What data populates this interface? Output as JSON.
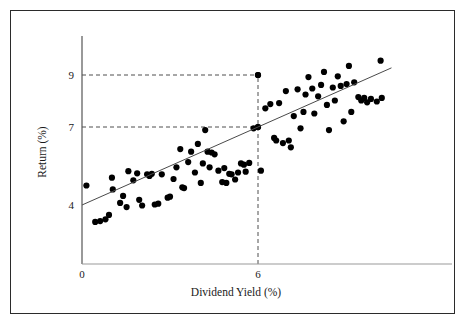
{
  "figure": {
    "border_color": "#2b2b2b",
    "background": "#ffffff"
  },
  "chart_data": {
    "type": "scatter",
    "title": "",
    "subtitle": "",
    "xlabel": "Dividend Yield (%)",
    "ylabel": "Return (%)",
    "xlim": [
      -0.2,
      11.0
    ],
    "ylim": [
      2.6,
      10.6
    ],
    "xticks": [
      "0",
      "6"
    ],
    "xtick_values": [
      0,
      6
    ],
    "yticks": [
      "4",
      "7",
      "9"
    ],
    "ytick_values": [
      4,
      7,
      9
    ],
    "grid": false,
    "legend": null,
    "marker_color": "#000000",
    "marker_size": 3.1,
    "fit_line": {
      "label": "regression-line",
      "color": "#4a4a4a",
      "width": 1.0,
      "intercept": 4.0,
      "slope": 0.5,
      "x_start": 0.0,
      "x_end": 10.55
    },
    "reference_lines": [
      {
        "name": "ref-horizontal-9",
        "orientation": "horizontal",
        "value": 9,
        "x_from": 0,
        "x_to": 6,
        "style": "dashed"
      },
      {
        "name": "ref-horizontal-7",
        "orientation": "horizontal",
        "value": 7,
        "x_from": 0,
        "x_to": 6,
        "style": "dashed"
      },
      {
        "name": "ref-vertical-6",
        "orientation": "vertical",
        "value": 6,
        "y_from": 2.6,
        "y_to": 9,
        "style": "dashed"
      }
    ],
    "highlight_points": [
      {
        "x": 6,
        "y": 9,
        "name": "point-at-6-9"
      },
      {
        "x": 6,
        "y": 7,
        "name": "point-at-6-7"
      }
    ],
    "points": [
      [
        0.15,
        4.75
      ],
      [
        0.45,
        3.35
      ],
      [
        0.62,
        3.38
      ],
      [
        0.8,
        3.45
      ],
      [
        0.92,
        3.62
      ],
      [
        1.02,
        5.05
      ],
      [
        1.05,
        4.6
      ],
      [
        1.3,
        4.08
      ],
      [
        1.4,
        4.35
      ],
      [
        1.52,
        3.92
      ],
      [
        1.58,
        5.3
      ],
      [
        1.75,
        4.95
      ],
      [
        1.88,
        5.22
      ],
      [
        1.95,
        4.2
      ],
      [
        2.05,
        3.98
      ],
      [
        2.22,
        5.18
      ],
      [
        2.3,
        5.12
      ],
      [
        2.38,
        5.2
      ],
      [
        2.48,
        4.02
      ],
      [
        2.6,
        4.05
      ],
      [
        2.72,
        5.18
      ],
      [
        2.92,
        4.28
      ],
      [
        3.0,
        4.32
      ],
      [
        3.12,
        5.0
      ],
      [
        3.22,
        5.45
      ],
      [
        3.35,
        6.15
      ],
      [
        3.42,
        4.68
      ],
      [
        3.48,
        4.65
      ],
      [
        3.62,
        5.65
      ],
      [
        3.72,
        6.05
      ],
      [
        3.85,
        5.25
      ],
      [
        3.95,
        6.35
      ],
      [
        4.05,
        4.85
      ],
      [
        4.12,
        5.6
      ],
      [
        4.2,
        6.88
      ],
      [
        4.28,
        6.05
      ],
      [
        4.35,
        5.45
      ],
      [
        4.42,
        6.02
      ],
      [
        4.52,
        5.95
      ],
      [
        4.65,
        5.32
      ],
      [
        4.78,
        4.88
      ],
      [
        4.85,
        5.42
      ],
      [
        4.92,
        4.85
      ],
      [
        5.02,
        5.2
      ],
      [
        5.1,
        5.18
      ],
      [
        5.22,
        4.98
      ],
      [
        5.32,
        5.25
      ],
      [
        5.42,
        5.6
      ],
      [
        5.52,
        5.55
      ],
      [
        5.58,
        5.28
      ],
      [
        5.7,
        5.62
      ],
      [
        5.85,
        6.95
      ],
      [
        6.0,
        9.0
      ],
      [
        6.0,
        7.0
      ],
      [
        6.1,
        5.32
      ],
      [
        6.25,
        7.72
      ],
      [
        6.42,
        7.88
      ],
      [
        6.55,
        6.58
      ],
      [
        6.62,
        6.48
      ],
      [
        6.72,
        7.92
      ],
      [
        6.85,
        6.38
      ],
      [
        6.95,
        8.38
      ],
      [
        7.05,
        6.48
      ],
      [
        7.12,
        6.22
      ],
      [
        7.22,
        7.42
      ],
      [
        7.35,
        8.45
      ],
      [
        7.45,
        6.95
      ],
      [
        7.55,
        7.58
      ],
      [
        7.62,
        8.25
      ],
      [
        7.72,
        8.92
      ],
      [
        7.85,
        8.48
      ],
      [
        7.92,
        7.52
      ],
      [
        8.05,
        8.18
      ],
      [
        8.15,
        8.62
      ],
      [
        8.25,
        9.12
      ],
      [
        8.35,
        7.85
      ],
      [
        8.42,
        6.88
      ],
      [
        8.55,
        8.52
      ],
      [
        8.62,
        8.02
      ],
      [
        8.72,
        8.95
      ],
      [
        8.82,
        8.58
      ],
      [
        8.92,
        7.22
      ],
      [
        9.02,
        8.65
      ],
      [
        9.1,
        9.35
      ],
      [
        9.18,
        7.58
      ],
      [
        9.28,
        8.72
      ],
      [
        9.42,
        8.15
      ],
      [
        9.52,
        8.02
      ],
      [
        9.62,
        8.12
      ],
      [
        9.72,
        7.95
      ],
      [
        9.85,
        8.08
      ],
      [
        10.05,
        7.98
      ],
      [
        10.18,
        9.55
      ],
      [
        10.22,
        8.12
      ]
    ]
  }
}
